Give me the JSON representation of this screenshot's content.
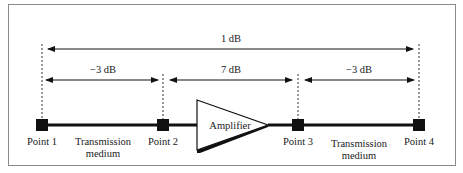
{
  "diagram": {
    "colors": {
      "line": "#111111",
      "frame": "#8a8a8a",
      "text": "#1a1a1a",
      "background": "#ffffff"
    },
    "points": [
      {
        "id": "p1",
        "label": "Point 1"
      },
      {
        "id": "p2",
        "label": "Point 2"
      },
      {
        "id": "p3",
        "label": "Point 3"
      },
      {
        "id": "p4",
        "label": "Point 4"
      }
    ],
    "segments": [
      {
        "from": "p1",
        "to": "p2",
        "line1": "Transmission",
        "line2": "medium"
      },
      {
        "from": "p3",
        "to": "p4",
        "line1": "Transmission",
        "line2": "medium"
      }
    ],
    "amplifier": {
      "label": "Amplifier"
    },
    "measurements": {
      "overall": {
        "from": "p1",
        "to": "p4",
        "label": "1 dB"
      },
      "parts": [
        {
          "from": "p1",
          "to": "p2",
          "label": "−3 dB"
        },
        {
          "from": "p2",
          "to": "p3",
          "label": "7 dB"
        },
        {
          "from": "p3",
          "to": "p4",
          "label": "−3 dB"
        }
      ]
    }
  }
}
